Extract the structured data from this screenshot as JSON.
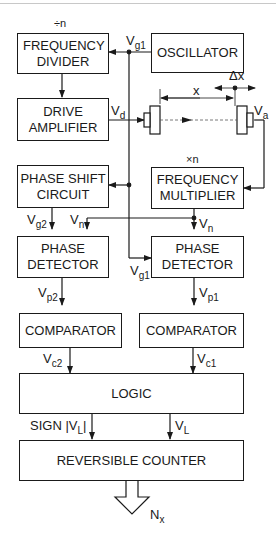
{
  "blocks": {
    "frequency_divider": "FREQUENCY DIVIDER",
    "oscillator": "OSCILLATOR",
    "drive_amplifier": "DRIVE AMPLIFIER",
    "phase_shift_circuit": "PHASE SHIFT CIRCUIT",
    "frequency_multiplier": "FREQUENCY MULTIPLIER",
    "phase_detector_left": "PHASE DETECTOR",
    "phase_detector_right": "PHASE DETECTOR",
    "comparator_left": "COMPARATOR",
    "comparator_right": "COMPARATOR",
    "logic": "LOGIC",
    "reversible_counter": "REVERSIBLE COUNTER"
  },
  "annotations": {
    "divide_n": "÷n",
    "multiply_n": "×n",
    "x": "x",
    "delta_x": "Δx"
  },
  "signals": {
    "vg1_top": {
      "base": "V",
      "sub": "g1"
    },
    "vd": {
      "base": "V",
      "sub": "d"
    },
    "va": {
      "base": "V",
      "sub": "a"
    },
    "vg2": {
      "base": "V",
      "sub": "g2"
    },
    "vn_left": {
      "base": "V",
      "sub": "n"
    },
    "vn_right": {
      "base": "V",
      "sub": "n"
    },
    "vg1_bottom": {
      "base": "V",
      "sub": "g1"
    },
    "vp2": {
      "base": "V",
      "sub": "p2"
    },
    "vp1": {
      "base": "V",
      "sub": "p1"
    },
    "vc2": {
      "base": "V",
      "sub": "c2"
    },
    "vc1": {
      "base": "V",
      "sub": "c1"
    },
    "sign_vl": {
      "base": "SIGN |V",
      "sub": "L",
      "suffix": "|"
    },
    "vl": {
      "base": "V",
      "sub": "L"
    },
    "nx": {
      "base": "N",
      "sub": "x"
    }
  }
}
